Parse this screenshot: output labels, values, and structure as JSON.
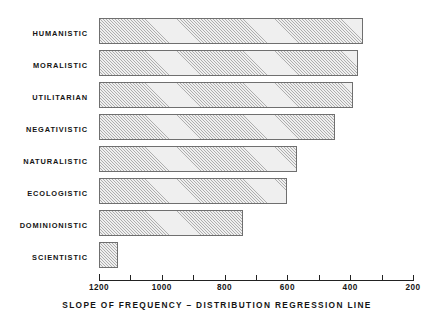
{
  "chart_data": {
    "type": "bar",
    "orientation": "horizontal",
    "title": "",
    "xlabel": "SLOPE OF FREQUENCY – DISTRIBUTION REGRESSION LINE",
    "ylabel": "",
    "grid": false,
    "legend": false,
    "xlim": [
      1200,
      200
    ],
    "x_axis_reversed": true,
    "xticks": [
      1200,
      1000,
      800,
      600,
      400,
      200
    ],
    "xtick_labels": [
      "1200",
      "1000",
      "800",
      "600",
      "400",
      "200"
    ],
    "minor_ticks": [
      1100,
      900,
      700,
      500,
      300
    ],
    "bar_baseline": 1200,
    "categories": [
      "HUMANISTIC",
      "MORALISTIC",
      "UTILITARIAN",
      "NEGATIVISTIC",
      "NATURALISTIC",
      "ECOLOGISTIC",
      "DOMINIONISTIC",
      "SCIENTISTIC"
    ],
    "values": [
      360,
      375,
      390,
      450,
      570,
      600,
      740,
      1140
    ],
    "bar_fill": "#efefef",
    "bar_hatch": "diagonal",
    "bar_edge_color": "#6f6f6f",
    "axis_color": "#222222",
    "background": "#ffffff"
  }
}
